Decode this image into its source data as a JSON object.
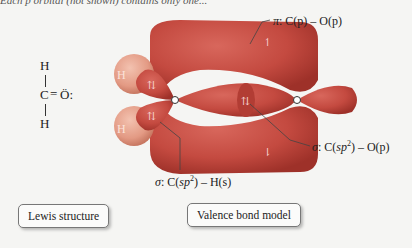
{
  "top_text": "Each p orbital (not shown) contains only one...",
  "lewis": {
    "h_top": "H",
    "carbon": "C",
    "double_bond": "=",
    "oxygen": "Ö:",
    "h_bottom": "H"
  },
  "orbital_model": {
    "h_atom_labels": [
      "H",
      "H"
    ],
    "carbon_label": "C",
    "electron_spin_glyphs": [
      "⇅",
      "⇅",
      "⇅",
      "↿",
      "⇂"
    ],
    "colors": {
      "lobe": "#c44a40",
      "lobe_dark": "#a8362f",
      "hydrogen": "#e8a08c",
      "background": "#f5f5f3"
    }
  },
  "labels": {
    "pi": {
      "sym": "π",
      "text": ": C(p) – O(p)"
    },
    "sigma_co": {
      "sym": "σ",
      "text_pre": ": C(",
      "sub": "sp",
      "sup": "2",
      "text_post": ") – O(p)"
    },
    "sigma_ch": {
      "sym": "σ",
      "text_pre": ": C(",
      "sub": "sp",
      "sup": "2",
      "text_post": ") – H(s)"
    }
  },
  "captions": {
    "lewis": "Lewis structure",
    "valence": "Valence bond model"
  }
}
